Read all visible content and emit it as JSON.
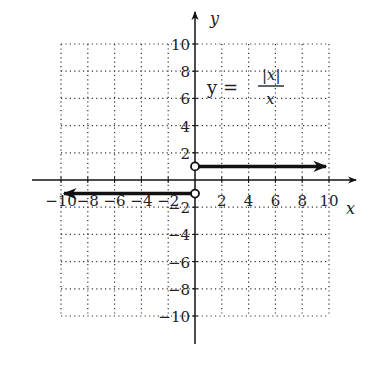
{
  "chart_data": {
    "type": "line",
    "title": "",
    "equation": {
      "lhs": "y =",
      "numerator": "|x|",
      "denominator": "x"
    },
    "xlabel": "x",
    "ylabel": "y",
    "xlim": [
      -10,
      10
    ],
    "ylim": [
      -10,
      10
    ],
    "grid": true,
    "grid_style": "dotted",
    "x_ticks": [
      -10,
      -8,
      -6,
      -4,
      -2,
      2,
      4,
      6,
      8,
      10
    ],
    "y_ticks": [
      -10,
      -8,
      -6,
      -4,
      -2,
      2,
      4,
      6,
      8,
      10
    ],
    "x_tick_labels": [
      "−10",
      "−8",
      "−6",
      "−4",
      "−2",
      "2",
      "4",
      "6",
      "8",
      "10"
    ],
    "y_tick_labels": [
      "−10",
      "−8",
      "−6",
      "−4",
      "−2",
      "2",
      "4",
      "6",
      "8",
      "10"
    ],
    "series": [
      {
        "name": "y = 1 for x > 0",
        "x": [
          0,
          10
        ],
        "y": [
          1,
          1
        ],
        "start_marker": "open-circle",
        "end_marker": "arrow"
      },
      {
        "name": "y = -1 for x < 0",
        "x": [
          0,
          -10
        ],
        "y": [
          -1,
          -1
        ],
        "start_marker": "open-circle",
        "end_marker": "arrow"
      }
    ],
    "colors": {
      "line": "#111111",
      "grid": "#333333",
      "axis": "#111111"
    }
  }
}
